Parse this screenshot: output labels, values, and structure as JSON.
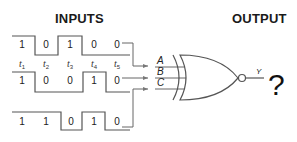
{
  "headings": {
    "inputs": "INPUTS",
    "output": "OUTPUT"
  },
  "time_labels": [
    {
      "base": "t",
      "sub": "1"
    },
    {
      "base": "t",
      "sub": "2"
    },
    {
      "base": "t",
      "sub": "3"
    },
    {
      "base": "t",
      "sub": "4"
    },
    {
      "base": "t",
      "sub": "5"
    }
  ],
  "waveforms": [
    {
      "input": "A",
      "bits": [
        "1",
        "0",
        "1",
        "0",
        "0"
      ]
    },
    {
      "input": "B",
      "bits": [
        "1",
        "0",
        "0",
        "1",
        "0"
      ]
    },
    {
      "input": "C",
      "bits": [
        "1",
        "1",
        "0",
        "1",
        "0"
      ]
    }
  ],
  "gate": {
    "type": "XNOR",
    "inputs": [
      "A",
      "B",
      "C"
    ],
    "output_label": "Y",
    "result": "?"
  },
  "colors": {
    "line": "#555555",
    "text": "#222222"
  }
}
